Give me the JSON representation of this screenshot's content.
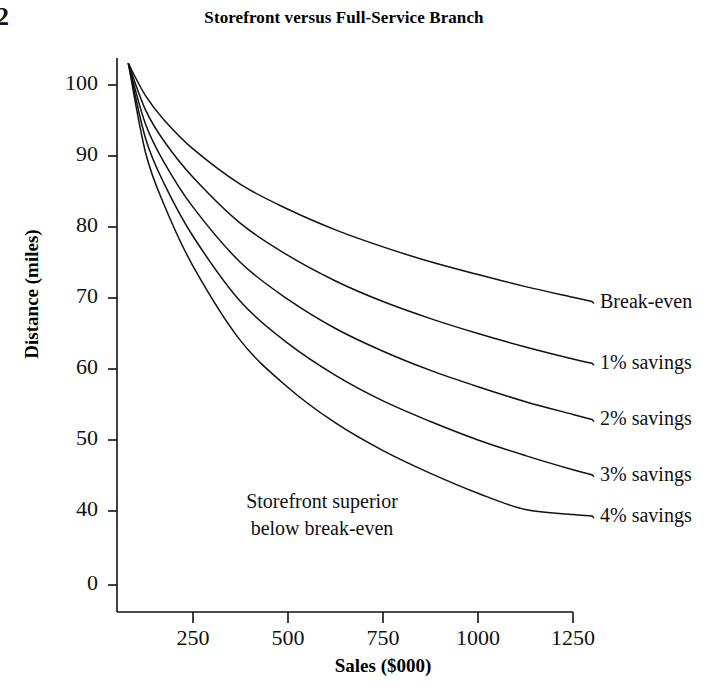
{
  "page_corner_mark": "2",
  "chart_data": {
    "type": "line",
    "title": "Storefront versus Full-Service Branch",
    "xlabel": "Sales ($000)",
    "ylabel": "Distance (miles)",
    "xlim": [
      0,
      1350
    ],
    "ylim": [
      0,
      105
    ],
    "grid": false,
    "legend_position": "right-of-line-ends",
    "xticks": [
      250,
      500,
      750,
      1000,
      1250
    ],
    "xtick_labels": [
      "250",
      "500",
      "750",
      "1000",
      "1250"
    ],
    "yticks": [
      0,
      40,
      50,
      60,
      70,
      80,
      90,
      100
    ],
    "ytick_labels": [
      "0",
      "40",
      "50",
      "60",
      "70",
      "80",
      "90",
      "100"
    ],
    "y_axis_break_note": "axis compressed between 0 and 40",
    "annotation": {
      "line1": "Storefront superior",
      "line2": "below break-even"
    },
    "x": [
      80,
      125,
      175,
      250,
      375,
      500,
      625,
      750,
      875,
      1000,
      1125,
      1250,
      1300
    ],
    "series": [
      {
        "name": "Break-even",
        "label": "Break-even",
        "values": [
          103.0,
          98.5,
          95.0,
          91.0,
          86.0,
          82.5,
          79.6,
          77.2,
          75.1,
          73.3,
          71.6,
          70.1,
          69.5
        ]
      },
      {
        "name": "1% savings",
        "label": "1% savings",
        "values": [
          103.0,
          96.5,
          92.0,
          87.0,
          80.5,
          76.0,
          72.4,
          69.5,
          67.1,
          65.0,
          63.1,
          61.4,
          60.8
        ]
      },
      {
        "name": "2% savings",
        "label": "2% savings",
        "values": [
          103.0,
          94.5,
          89.0,
          82.8,
          75.0,
          69.8,
          65.7,
          62.5,
          59.8,
          57.5,
          55.4,
          53.6,
          52.9
        ]
      },
      {
        "name": "3% savings",
        "label": "3% savings",
        "values": [
          103.0,
          92.5,
          86.0,
          78.7,
          69.5,
          63.6,
          59.1,
          55.5,
          52.6,
          50.0,
          47.8,
          45.8,
          45.1
        ]
      },
      {
        "name": "4% savings",
        "label": "4% savings",
        "values": [
          103.0,
          90.5,
          83.0,
          74.5,
          64.0,
          57.4,
          52.4,
          48.5,
          45.3,
          42.5,
          40.2,
          38.1,
          37.3
        ]
      }
    ]
  }
}
